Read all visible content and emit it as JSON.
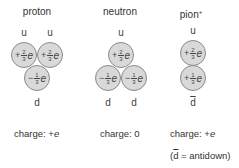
{
  "particles": [
    {
      "name": "proton",
      "top_quarks": [
        "u",
        "u"
      ],
      "bottom_quarks": [
        "d"
      ],
      "circles": [
        {
          "sign": "+",
          "num": "2",
          "den": "3",
          "unit": "e"
        },
        {
          "sign": "+",
          "num": "2",
          "den": "3",
          "unit": "e"
        },
        {
          "sign": "−",
          "num": "1",
          "den": "3",
          "unit": "e"
        }
      ],
      "charge": "charge: +e"
    },
    {
      "name": "neutron",
      "top_quarks": [
        "u"
      ],
      "bottom_quarks": [
        "d",
        "d"
      ],
      "circles": [
        {
          "sign": "+",
          "num": "2",
          "den": "3",
          "unit": "e"
        },
        {
          "sign": "−",
          "num": "1",
          "den": "3",
          "unit": "e"
        },
        {
          "sign": "−",
          "num": "1",
          "den": "3",
          "unit": "e"
        }
      ],
      "charge": "charge: 0"
    },
    {
      "name": "pion",
      "name_sup": "+",
      "top_quarks": [
        "u"
      ],
      "bottom_quarks": [
        "d"
      ],
      "circles": [
        {
          "sign": "+",
          "num": "2",
          "den": "3",
          "unit": "e"
        },
        {
          "sign": "+",
          "num": "1",
          "den": "3",
          "unit": "e"
        }
      ],
      "charge": "charge: +e"
    }
  ],
  "footnote": {
    "open": "(",
    "bar_letter": "d",
    "rest": " = antidown)"
  },
  "colors": {
    "circle_fill": "#d9d9d9",
    "circle_stroke": "#8a8a8a",
    "text": "#333333"
  }
}
